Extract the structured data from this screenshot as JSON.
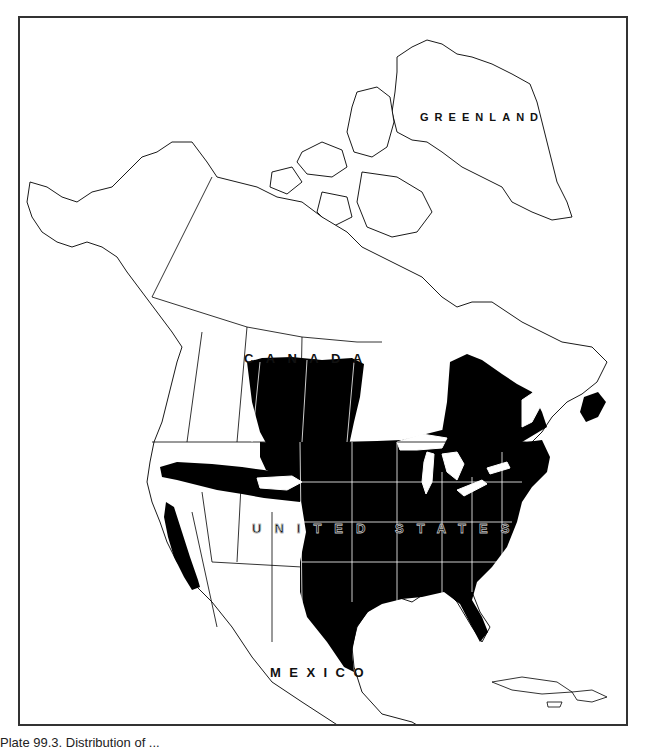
{
  "map": {
    "type": "range-map",
    "region": "North America",
    "colors": {
      "range_fill": "#000000",
      "land_fill": "#ffffff",
      "border_stroke": "#000000",
      "border_stroke_in_range": "#ffffff",
      "frame": "#333333"
    },
    "labels": {
      "greenland": "GREENLAND",
      "canada": "CANADA",
      "united_states": "UNITED STATES",
      "mexico": "MEXICO"
    },
    "range_areas": [
      "Eastern and central United States (Great Plains to Atlantic coast, Gulf Coast incl. Texas and Florida)",
      "Southern Canadian prairies (Alberta, Saskatchewan, Manitoba)",
      "Southern Ontario and Quebec, Maritime provinces",
      "Band across the northern Great Basin / Snake River region",
      "California coastal and Central Valley strip"
    ]
  },
  "caption": {
    "text": "Plate 99.3. Distribution of ..."
  }
}
